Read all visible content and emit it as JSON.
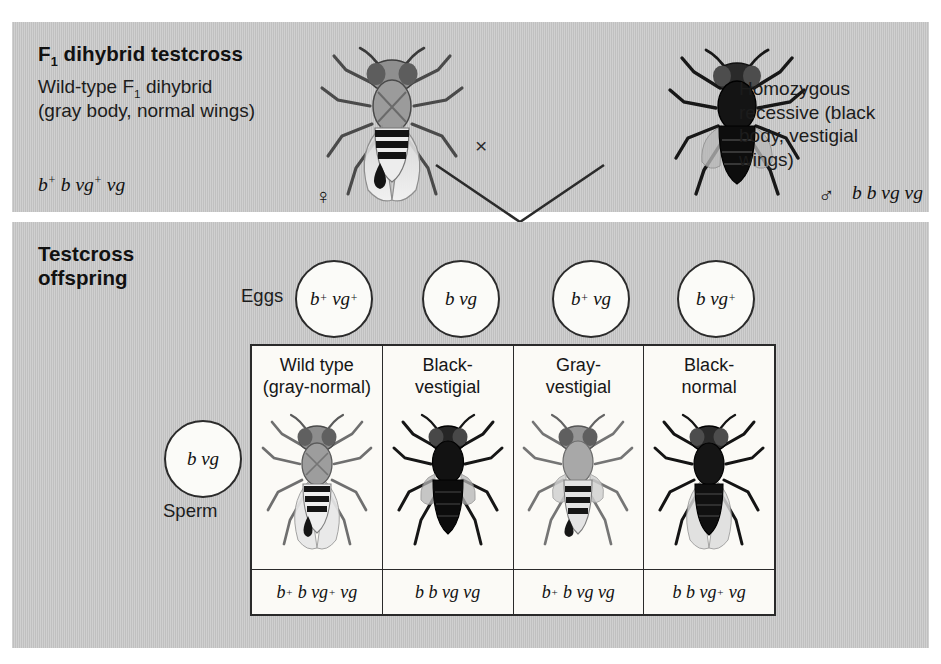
{
  "figure": {
    "top_panel": {
      "title": "F1 dihybrid testcross",
      "title_main": "F",
      "title_sub": "1",
      "title_rest": " dihybrid testcross",
      "female_description": "Wild-type F1 dihybrid\n(gray body, normal wings)",
      "female_desc_line1_a": "Wild-type F",
      "female_desc_line1_sub": "1",
      "female_desc_line1_b": " dihybrid",
      "female_desc_line2": "(gray body, normal wings)",
      "female_genotype": "b+ b vg+ vg",
      "female_symbol": "♀",
      "cross_symbol": "×",
      "male_description": "Homozygous\nrecessive (black\nbody, vestigial\nwings)",
      "male_genotype": "b b vg vg",
      "male_symbol": "♂"
    },
    "bottom_panel": {
      "title": "Testcross\noffspring",
      "eggs_label": "Eggs",
      "sperm_label": "Sperm",
      "sperm_gamete": "b vg",
      "eggs": [
        {
          "name": "parental-gray-normal",
          "label": "b+ vg+"
        },
        {
          "name": "parental-black-vestigial",
          "label": "b vg"
        },
        {
          "name": "recombinant-gray-vestigial",
          "label": "b+ vg"
        },
        {
          "name": "recombinant-black-normal",
          "label": "b vg+"
        }
      ],
      "offspring": [
        {
          "header": "Wild type\n(gray-normal)",
          "genotype": "b+ b vg+ vg",
          "body_color": "#9a9a9a",
          "wing": "normal",
          "class": "parental"
        },
        {
          "header": "Black-\nvestigial",
          "genotype": "b b vg vg",
          "body_color": "#171717",
          "wing": "vestigial",
          "class": "parental"
        },
        {
          "header": "Gray-\nvestigial",
          "genotype": "b+ b vg vg",
          "body_color": "#a5a5a5",
          "wing": "vestigial",
          "class": "recombinant"
        },
        {
          "header": "Black-\nnormal",
          "genotype": "b b vg+ vg",
          "body_color": "#1b1b1b",
          "wing": "normal",
          "class": "recombinant"
        }
      ]
    },
    "colors": {
      "panel_gray": "#c7c7c7",
      "page_background": "#ffffff",
      "ink": "#1a1a1a",
      "grid_background": "#fbfaf6",
      "border": "#2a2a2a"
    }
  }
}
